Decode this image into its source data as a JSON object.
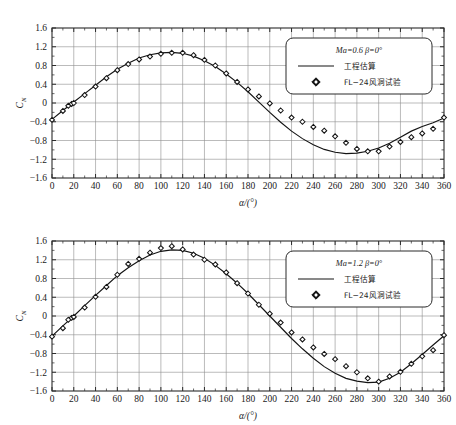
{
  "figure": {
    "background_color": "#ffffff",
    "line_color": "#141414",
    "grid_color": "#8d8d8d",
    "frame_color": "#2b2b2b"
  },
  "chart_data": [
    {
      "type": "line",
      "id": "chart-ma-0-6",
      "title": "",
      "xlabel": "α/(°)",
      "ylabel": "Cₙ",
      "ylabel_base": "C",
      "ylabel_sub": "N",
      "xlim": [
        0,
        360
      ],
      "ylim": [
        -1.6,
        1.6
      ],
      "xticks": [
        0,
        20,
        40,
        60,
        80,
        100,
        120,
        140,
        160,
        180,
        200,
        220,
        240,
        260,
        280,
        300,
        320,
        340,
        360
      ],
      "xticklabels": [
        "0",
        "20",
        "40",
        "60",
        "80",
        "100",
        "120",
        "140",
        "160",
        "180",
        "200",
        "220",
        "240",
        "260",
        "280",
        "300",
        "320",
        "340",
        "360"
      ],
      "yticks": [
        -1.6,
        -1.2,
        -0.8,
        -0.4,
        0,
        0.4,
        0.8,
        1.2,
        1.6
      ],
      "yticklabels": [
        "−1.6",
        "−1.2",
        "−0.8",
        "−0.4",
        "0",
        "0.4",
        "0.8",
        "1.2",
        "1.6"
      ],
      "grid": true,
      "legend_position": "upper-right",
      "legend": {
        "condition": "Ma=0.6  β=0°",
        "condition_ma_label": "Ma",
        "condition_ma_value": "=0.6",
        "condition_beta_label": "β",
        "condition_beta_value": "=0°",
        "entries": [
          {
            "kind": "line",
            "label": "工程估算"
          },
          {
            "kind": "marker",
            "label": "FL−24风洞试验"
          }
        ]
      },
      "series": [
        {
          "name": "工程估算",
          "kind": "line",
          "x": [
            0,
            10,
            20,
            30,
            40,
            50,
            60,
            70,
            80,
            90,
            100,
            110,
            120,
            130,
            140,
            150,
            160,
            170,
            180,
            190,
            200,
            210,
            220,
            230,
            240,
            250,
            260,
            270,
            280,
            290,
            300,
            310,
            320,
            330,
            340,
            350,
            360
          ],
          "y": [
            -0.35,
            -0.16,
            0.02,
            0.2,
            0.38,
            0.56,
            0.72,
            0.85,
            0.96,
            1.03,
            1.07,
            1.08,
            1.06,
            1.0,
            0.9,
            0.78,
            0.62,
            0.44,
            0.24,
            0.02,
            -0.2,
            -0.41,
            -0.6,
            -0.76,
            -0.89,
            -0.99,
            -1.05,
            -1.08,
            -1.07,
            -1.03,
            -0.96,
            -0.86,
            -0.73,
            -0.6,
            -0.5,
            -0.42,
            -0.32
          ]
        },
        {
          "name": "FL−24风洞试验",
          "kind": "scatter",
          "marker": "diamond",
          "x": [
            0,
            10,
            15,
            18,
            20,
            30,
            40,
            50,
            60,
            70,
            80,
            90,
            100,
            110,
            120,
            130,
            140,
            150,
            160,
            170,
            180,
            190,
            200,
            210,
            220,
            230,
            240,
            250,
            260,
            270,
            280,
            290,
            300,
            310,
            320,
            330,
            340,
            350,
            360
          ],
          "y": [
            -0.36,
            -0.17,
            -0.06,
            -0.02,
            0.0,
            0.17,
            0.35,
            0.53,
            0.7,
            0.83,
            0.93,
            0.99,
            1.05,
            1.07,
            1.07,
            1.02,
            0.92,
            0.8,
            0.63,
            0.45,
            0.29,
            0.14,
            -0.01,
            -0.16,
            -0.31,
            -0.4,
            -0.51,
            -0.59,
            -0.71,
            -0.85,
            -0.98,
            -1.03,
            -1.03,
            -0.93,
            -0.83,
            -0.73,
            -0.65,
            -0.55,
            -0.31
          ]
        }
      ]
    },
    {
      "type": "line",
      "id": "chart-ma-1-2",
      "title": "",
      "xlabel": "α/(°)",
      "ylabel": "Cₙ",
      "ylabel_base": "C",
      "ylabel_sub": "N",
      "xlim": [
        0,
        360
      ],
      "ylim": [
        -1.6,
        1.6
      ],
      "xticks": [
        0,
        20,
        40,
        60,
        80,
        100,
        120,
        140,
        160,
        180,
        200,
        220,
        240,
        260,
        280,
        300,
        320,
        340,
        360
      ],
      "xticklabels": [
        "0",
        "20",
        "40",
        "60",
        "80",
        "100",
        "120",
        "140",
        "160",
        "180",
        "200",
        "220",
        "240",
        "260",
        "280",
        "300",
        "320",
        "340",
        "360"
      ],
      "yticks": [
        -1.6,
        -1.2,
        -0.8,
        -0.4,
        0,
        0.4,
        0.8,
        1.2,
        1.6
      ],
      "yticklabels": [
        "−1.6",
        "−1.2",
        "−0.8",
        "−0.4",
        "0",
        "0.4",
        "0.8",
        "1.2",
        "1.6"
      ],
      "grid": true,
      "legend_position": "upper-right",
      "legend": {
        "condition": "Ma=1.2  β=0°",
        "condition_ma_label": "Ma",
        "condition_ma_value": "=1.2",
        "condition_beta_label": "β",
        "condition_beta_value": "=0°",
        "entries": [
          {
            "kind": "line",
            "label": "工程估算"
          },
          {
            "kind": "marker",
            "label": "FL−24风洞试验"
          }
        ]
      },
      "series": [
        {
          "name": "工程估算",
          "kind": "line",
          "x": [
            0,
            10,
            20,
            30,
            40,
            50,
            60,
            70,
            80,
            90,
            100,
            110,
            120,
            130,
            140,
            150,
            160,
            170,
            180,
            190,
            200,
            210,
            220,
            230,
            240,
            250,
            260,
            270,
            280,
            290,
            300,
            310,
            320,
            330,
            340,
            350,
            360
          ],
          "y": [
            -0.43,
            -0.21,
            0.0,
            0.22,
            0.44,
            0.65,
            0.86,
            1.03,
            1.18,
            1.3,
            1.38,
            1.41,
            1.4,
            1.34,
            1.23,
            1.08,
            0.9,
            0.7,
            0.48,
            0.24,
            0.0,
            -0.24,
            -0.48,
            -0.7,
            -0.9,
            -1.08,
            -1.22,
            -1.33,
            -1.39,
            -1.42,
            -1.41,
            -1.33,
            -1.2,
            -1.02,
            -0.82,
            -0.62,
            -0.42
          ]
        },
        {
          "name": "FL−24风洞试验",
          "kind": "scatter",
          "marker": "diamond",
          "x": [
            0,
            10,
            15,
            18,
            20,
            30,
            40,
            50,
            60,
            70,
            80,
            90,
            100,
            110,
            120,
            130,
            140,
            150,
            160,
            170,
            180,
            190,
            200,
            210,
            220,
            230,
            240,
            250,
            260,
            270,
            280,
            290,
            300,
            310,
            320,
            330,
            340,
            350,
            360
          ],
          "y": [
            -0.44,
            -0.26,
            -0.08,
            -0.04,
            -0.02,
            0.18,
            0.41,
            0.62,
            0.88,
            1.11,
            1.22,
            1.35,
            1.45,
            1.49,
            1.42,
            1.31,
            1.2,
            1.1,
            0.93,
            0.7,
            0.48,
            0.24,
            0.05,
            -0.14,
            -0.35,
            -0.5,
            -0.67,
            -0.81,
            -0.92,
            -1.07,
            -1.2,
            -1.33,
            -1.4,
            -1.29,
            -1.19,
            -1.02,
            -0.86,
            -0.73,
            -0.41
          ]
        }
      ]
    }
  ]
}
